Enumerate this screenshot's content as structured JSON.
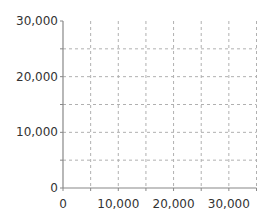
{
  "chart_data": {
    "type": "scatter",
    "title": "",
    "xlabel": "",
    "ylabel": "",
    "xlim": [
      0,
      35000
    ],
    "ylim": [
      0,
      30000
    ],
    "x_ticks": [
      "0",
      "10,000",
      "20,000",
      "30,000"
    ],
    "y_ticks": [
      "0",
      "10,000",
      "20,000",
      "30,000"
    ],
    "x_tick_values": [
      0,
      10000,
      20000,
      30000
    ],
    "y_tick_values": [
      0,
      10000,
      20000,
      30000
    ],
    "grid": {
      "on": true,
      "style": "dashed",
      "x_step": 5000,
      "y_step": 5000
    },
    "series": [],
    "legend": null
  },
  "colors": {
    "axis": "#888888",
    "grid": "#b0b0b0",
    "text": "#333333"
  }
}
